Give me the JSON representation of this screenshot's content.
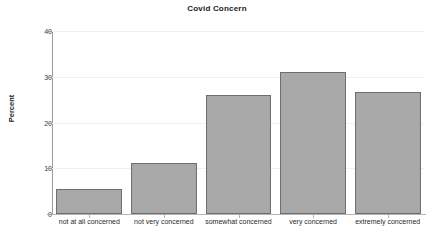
{
  "chart_data": {
    "type": "bar",
    "title": "Covid Concern",
    "xlabel": "",
    "ylabel": "Percent",
    "categories": [
      "not at all concerned",
      "not very concerned",
      "somewhat concerned",
      "very concerned",
      "extremely concerned"
    ],
    "values": [
      5.4,
      11.1,
      26.1,
      31.0,
      26.7
    ],
    "ylim": [
      0,
      40
    ],
    "yticks": [
      0,
      10,
      20,
      30,
      40
    ],
    "ytick_labels": [
      "0",
      "10",
      "20",
      "30",
      "40"
    ],
    "grid": true,
    "legend": "none",
    "bar_fill_color": "#a9a9a9",
    "bar_border_color": "#6e6e6e",
    "gridline_color": "#f0f0f0",
    "background_color": "#ffffff"
  }
}
